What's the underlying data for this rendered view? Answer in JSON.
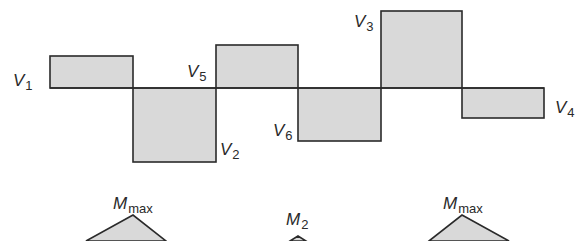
{
  "diagram": {
    "type": "shear-and-moment-diagram",
    "colors": {
      "fill": "#d9d9d9",
      "stroke": "#2a2a2a",
      "background": "#ffffff"
    },
    "shear": {
      "baseline_y": 88,
      "segments": [
        {
          "id": "V1",
          "letter": "V",
          "sub": "1",
          "x0": 50,
          "x1": 133,
          "top": 56,
          "bottom": 88
        },
        {
          "id": "V2",
          "letter": "V",
          "sub": "2",
          "x0": 133,
          "x1": 216,
          "top": 88,
          "bottom": 162
        },
        {
          "id": "V5",
          "letter": "V",
          "sub": "5",
          "x0": 216,
          "x1": 298,
          "top": 45,
          "bottom": 88
        },
        {
          "id": "V6",
          "letter": "V",
          "sub": "6",
          "x0": 298,
          "x1": 381,
          "top": 88,
          "bottom": 141
        },
        {
          "id": "V3",
          "letter": "V",
          "sub": "3",
          "x0": 381,
          "x1": 462,
          "top": 11,
          "bottom": 88
        },
        {
          "id": "V4",
          "letter": "V",
          "sub": "4",
          "x0": 462,
          "x1": 544,
          "top": 88,
          "bottom": 118
        }
      ],
      "labels": [
        {
          "letter": "V",
          "sub": "1",
          "x": 13,
          "y": 86
        },
        {
          "letter": "V",
          "sub": "2",
          "x": 220,
          "y": 155
        },
        {
          "letter": "V",
          "sub": "5",
          "x": 187,
          "y": 77
        },
        {
          "letter": "V",
          "sub": "6",
          "x": 273,
          "y": 136
        },
        {
          "letter": "V",
          "sub": "3",
          "x": 354,
          "y": 27
        },
        {
          "letter": "V",
          "sub": "4",
          "x": 555,
          "y": 113
        }
      ]
    },
    "moment": {
      "peaks": [
        {
          "id": "Mmax-left",
          "letter": "M",
          "sub": "max",
          "peak_x": 133,
          "peak_y": 215,
          "left_x": 86,
          "right_x": 166,
          "label_x": 113,
          "label_y": 209
        },
        {
          "id": "M2",
          "letter": "M",
          "sub": "2",
          "peak_x": 298,
          "peak_y": 236,
          "left_x": 290,
          "right_x": 306,
          "label_x": 286,
          "label_y": 225
        },
        {
          "id": "Mmax-right",
          "letter": "M",
          "sub": "max",
          "peak_x": 462,
          "peak_y": 215,
          "left_x": 429,
          "right_x": 509,
          "label_x": 443,
          "label_y": 209
        }
      ]
    }
  }
}
